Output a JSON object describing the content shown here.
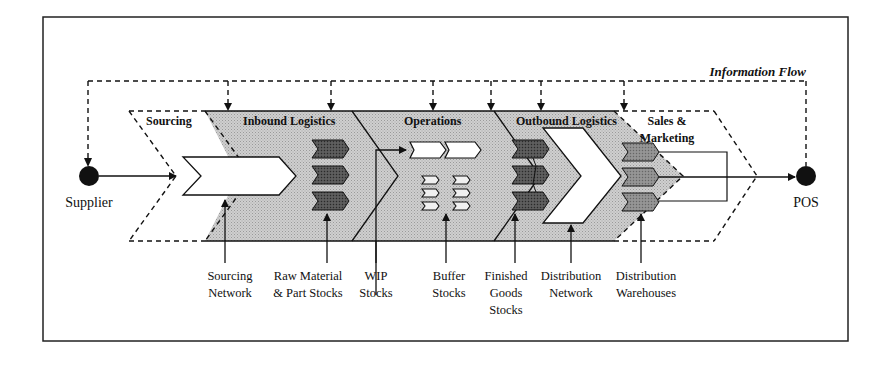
{
  "diagram": {
    "title": "Information Flow",
    "nodes": {
      "supplier": "Supplier",
      "pos": "POS"
    },
    "stages": [
      {
        "id": "sourcing",
        "label": "Sourcing"
      },
      {
        "id": "inbound",
        "label": "Inbound Logistics"
      },
      {
        "id": "operations",
        "label": "Operations"
      },
      {
        "id": "outbound",
        "label": "Outbound Logistics"
      },
      {
        "id": "sales",
        "label_line1": "Sales &",
        "label_line2": "Marketing"
      }
    ],
    "callouts": [
      {
        "id": "sourcing-network",
        "lines": [
          "Sourcing",
          "Network"
        ]
      },
      {
        "id": "raw-material",
        "lines": [
          "Raw Material",
          "& Part Stocks"
        ]
      },
      {
        "id": "wip",
        "lines": [
          "WIP",
          "Stocks"
        ]
      },
      {
        "id": "buffer",
        "lines": [
          "Buffer",
          "Stocks"
        ]
      },
      {
        "id": "finished-goods",
        "lines": [
          "Finished",
          "Goods",
          "Stocks"
        ]
      },
      {
        "id": "distribution-network",
        "lines": [
          "Distribution",
          "Network"
        ]
      },
      {
        "id": "distribution-warehouses",
        "lines": [
          "Distribution",
          "Warehouses"
        ]
      }
    ],
    "colors": {
      "band_fill": "#c8c8c8",
      "dark_chevron": "#4a4a4a",
      "mid_chevron": "#8a8a8a",
      "line": "#111111"
    }
  }
}
